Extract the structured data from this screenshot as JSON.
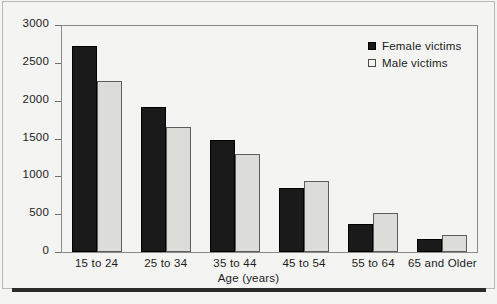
{
  "chart_data": {
    "type": "bar",
    "title": "",
    "xlabel": "Age (years)",
    "ylabel": "",
    "ylim": [
      0,
      3000
    ],
    "ytick_step": 500,
    "yticks": [
      "3000",
      "2500",
      "2000",
      "1500",
      "1000",
      "500",
      "0"
    ],
    "grid": false,
    "legend_position": "top-right",
    "categories": [
      "15 to 24",
      "25 to 34",
      "35 to 44",
      "45 to 54",
      "55 to 64",
      "65 and Older"
    ],
    "series": [
      {
        "name": "Female victims",
        "color": "#1a1a1a",
        "values": [
          2720,
          1910,
          1480,
          850,
          370,
          175
        ]
      },
      {
        "name": "Male victims",
        "color": "#dcdcd8",
        "values": [
          2260,
          1650,
          1290,
          940,
          510,
          230
        ]
      }
    ]
  },
  "legend": {
    "items": [
      {
        "label": "Female victims",
        "swatch": "filled-dark-square"
      },
      {
        "label": "Male victims",
        "swatch": "open-light-square"
      }
    ]
  },
  "axes": {
    "x_title": "Age (years)"
  }
}
